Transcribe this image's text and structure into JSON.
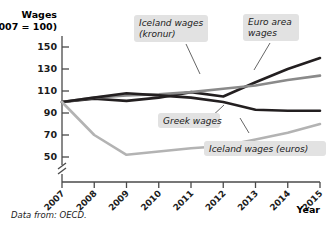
{
  "chart_data": {
    "type": "line",
    "title": "",
    "ylabel": "Wages",
    "ylabel_sub": "(2007 = 100)",
    "xlabel": "Year",
    "categories": [
      "2007",
      "2008",
      "2009",
      "2010",
      "2011",
      "2012",
      "2013",
      "2014",
      "2015"
    ],
    "x": [
      2007,
      2008,
      2009,
      2010,
      2011,
      2012,
      2013,
      2014,
      2015
    ],
    "yticks": [
      150,
      130,
      110,
      90,
      70,
      50
    ],
    "ylim": [
      44,
      158
    ],
    "xlim": [
      2007,
      2015
    ],
    "axis_break": true,
    "grid": false,
    "legend": "annotations",
    "series": [
      {
        "name": "Iceland wages (kronur)",
        "color": "#231f20",
        "width": 2.6,
        "values": [
          100,
          103,
          101,
          104,
          109,
          105,
          118,
          130,
          140
        ]
      },
      {
        "name": "Euro area wages",
        "color": "#8a8a8a",
        "width": 2.6,
        "values": [
          100,
          104,
          106,
          107,
          109,
          112,
          115,
          120,
          124
        ]
      },
      {
        "name": "Greek wages",
        "color": "#231f20",
        "width": 2.6,
        "values": [
          100,
          104,
          108,
          106,
          104,
          100,
          93,
          92,
          92
        ]
      },
      {
        "name": "Iceland wages (euros)",
        "color": "#b3b3b3",
        "width": 2.6,
        "values": [
          100,
          70,
          52,
          55,
          58,
          60,
          66,
          72,
          80
        ]
      }
    ],
    "annotations": [
      {
        "id": "iceland-kronur",
        "label_lines": [
          "Iceland wages",
          "(kronur)"
        ]
      },
      {
        "id": "euro-area",
        "label_lines": [
          "Euro area",
          "wages"
        ]
      },
      {
        "id": "greek",
        "label_lines": [
          "Greek wages"
        ]
      },
      {
        "id": "iceland-euros",
        "label_lines": [
          "Iceland wages  (euros)"
        ]
      }
    ],
    "source_prefix": "Data from:",
    "source_value": "OECD."
  }
}
